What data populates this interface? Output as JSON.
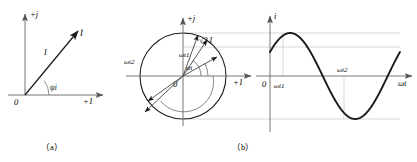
{
  "figure": {
    "panel_a": {
      "caption": "（a）",
      "axis_vertical": "+j",
      "axis_horizontal": "+1",
      "origin": "0",
      "phasor_label": "İ",
      "magnitude_label": "I",
      "angle_label": "ψi"
    },
    "panel_b": {
      "caption": "（b）",
      "axis_vertical": "+j",
      "axis_horizontal": "+1",
      "origin": "0",
      "radius_label": "√2 I",
      "angle_psi": "ψi",
      "angle_wt1": "ωt1",
      "angle_wt2": "ωt2",
      "wave_axis_vertical": "i",
      "wave_axis_horizontal": "ωt",
      "wave_origin": "0",
      "wave_mark_1": "ωt1",
      "wave_mark_2": "ωt2"
    }
  },
  "chart_data": {
    "type": "line",
    "title": "",
    "xlabel": "ωt",
    "ylabel": "i",
    "x": [
      0,
      15,
      30,
      45,
      60,
      75,
      90,
      105,
      120,
      135,
      150,
      165,
      180,
      195,
      210,
      225,
      240,
      255,
      270,
      285,
      300,
      315,
      330,
      345,
      360
    ],
    "values": [
      0.559,
      0.793,
      0.951,
      1.0,
      0.951,
      0.793,
      0.559,
      0.259,
      -0.071,
      -0.391,
      -0.669,
      -0.875,
      -0.985,
      -0.985,
      -0.875,
      -0.669,
      -0.391,
      -0.071,
      0.259,
      0.559,
      0.793,
      0.951,
      1.0,
      0.951,
      0.793
    ],
    "amplitude": 1.0,
    "amplitude_label": "√2 I",
    "phase_offset_deg": 34,
    "annotations": [
      {
        "label": "ωt1",
        "x_deg": 45,
        "y": 1.0
      },
      {
        "label": "ωt2",
        "x_deg": 216,
        "y": 0.0
      }
    ],
    "ylim": [
      -1.15,
      1.15
    ],
    "xlim": [
      0,
      360
    ],
    "grid": false,
    "legend": false
  }
}
